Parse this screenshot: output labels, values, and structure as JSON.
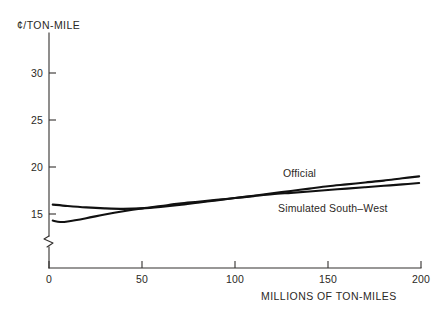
{
  "chart_data": {
    "type": "line",
    "title": "",
    "subtitle": "",
    "xlabel": "MILLIONS OF TON-MILES",
    "ylabel": "¢/TON-MILE",
    "xlim": [
      0,
      200
    ],
    "ylim": [
      13.5,
      32
    ],
    "grid": false,
    "legend_position": "inline-annotation",
    "y_axis_break": true,
    "y_axis_break_note": "axis broken between 0 and ~14",
    "xticks": [
      0,
      50,
      100,
      150,
      200
    ],
    "xticklabels": [
      "0",
      "50",
      "100",
      "150",
      "200"
    ],
    "yticks": [
      15,
      20,
      25,
      30
    ],
    "yticklabels": [
      "15",
      "20",
      "25",
      "30"
    ],
    "series": [
      {
        "name": "Official",
        "label": "Official",
        "x": [
          2,
          10,
          20,
          30,
          40,
          50,
          60,
          70,
          80,
          90,
          100,
          110,
          120,
          130,
          140,
          150,
          160,
          170,
          180,
          190,
          199
        ],
        "values": [
          16.0,
          15.85,
          15.7,
          15.6,
          15.55,
          15.6,
          15.75,
          15.95,
          16.2,
          16.45,
          16.7,
          16.95,
          17.2,
          17.45,
          17.7,
          17.95,
          18.15,
          18.35,
          18.55,
          18.8,
          19.0
        ]
      },
      {
        "name": "Simulated South-West",
        "label": "Simulated South–West",
        "x": [
          2,
          6,
          10,
          20,
          30,
          40,
          50,
          60,
          70,
          80,
          90,
          100,
          110,
          120,
          130,
          140,
          150,
          160,
          170,
          180,
          190,
          199
        ],
        "values": [
          14.3,
          14.15,
          14.2,
          14.55,
          14.95,
          15.3,
          15.6,
          15.85,
          16.1,
          16.3,
          16.5,
          16.7,
          16.9,
          17.1,
          17.25,
          17.4,
          17.55,
          17.7,
          17.85,
          18.0,
          18.15,
          18.3
        ]
      }
    ],
    "annotations": [
      {
        "text": "Official",
        "x": 100,
        "y": 20.1
      },
      {
        "text": "Simulated South–West",
        "x": 100,
        "y": 16.4
      }
    ]
  },
  "colors": {
    "background": "#ffffff",
    "axis": "#33302e",
    "curve": "#111111",
    "text": "#2b2825"
  }
}
